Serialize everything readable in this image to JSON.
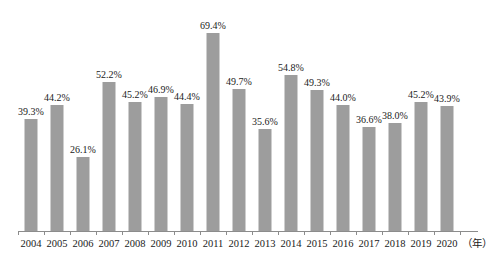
{
  "chart_data": {
    "type": "bar",
    "title": "",
    "subtitle": "",
    "xlabel": "（年）",
    "ylabel": "",
    "ylim": [
      0,
      72
    ],
    "grid": false,
    "legend": "none",
    "bar_color": "#9d9d9d",
    "axis_color": "#8c8c8c",
    "text_color": "#1a1a1a",
    "categories": [
      "2004",
      "2005",
      "2006",
      "2007",
      "2008",
      "2009",
      "2010",
      "2011",
      "2012",
      "2013",
      "2014",
      "2015",
      "2016",
      "2017",
      "2018",
      "2019",
      "2020"
    ],
    "values": [
      39.3,
      44.2,
      26.1,
      52.2,
      45.2,
      46.9,
      44.4,
      69.4,
      49.7,
      35.6,
      54.8,
      49.3,
      44.0,
      36.6,
      38.0,
      45.2,
      43.9
    ],
    "value_labels": [
      "39.3%",
      "44.2%",
      "26.1%",
      "52.2%",
      "45.2%",
      "46.9%",
      "44.4%",
      "69.4%",
      "49.7%",
      "35.6%",
      "54.8%",
      "49.3%",
      "44.0%",
      "36.6%",
      "38.0%",
      "45.2%",
      "43.9%"
    ]
  }
}
